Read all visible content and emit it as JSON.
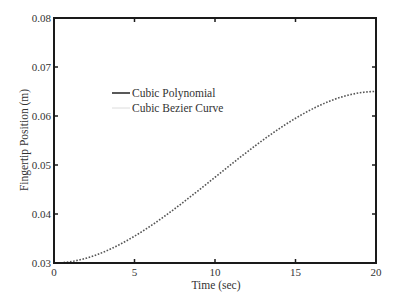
{
  "chart_data": {
    "type": "line",
    "title": "",
    "xlabel": "Time (sec)",
    "ylabel": "Fingertip Position (m)",
    "xlim": [
      0,
      20
    ],
    "ylim": [
      0.03,
      0.08
    ],
    "xticks": [
      0,
      5,
      10,
      15,
      20
    ],
    "xtick_labels": [
      "0",
      "5",
      "10",
      "15",
      "20"
    ],
    "yticks": [
      0.03,
      0.04,
      0.05,
      0.06,
      0.07,
      0.08
    ],
    "ytick_labels": [
      "0.03",
      "0.04",
      "0.05",
      "0.06",
      "0.07",
      "0.08"
    ],
    "grid": false,
    "legend_position": "upper left (inside)",
    "x": [
      0,
      2,
      4,
      6,
      8,
      10,
      12,
      14,
      16,
      18,
      20
    ],
    "series": [
      {
        "name": "Cubic Polynomial",
        "style": "solid",
        "color": "#222222",
        "values": [
          0.03,
          0.03098,
          0.03364,
          0.03756,
          0.04232,
          0.0475,
          0.05268,
          0.05744,
          0.06136,
          0.06402,
          0.065
        ]
      },
      {
        "name": "Cubic Bezier Curve",
        "style": "dotted",
        "color": "#888888",
        "values": [
          0.03,
          0.03098,
          0.03364,
          0.03756,
          0.04232,
          0.0475,
          0.05268,
          0.05744,
          0.06136,
          0.06402,
          0.065
        ]
      }
    ]
  }
}
